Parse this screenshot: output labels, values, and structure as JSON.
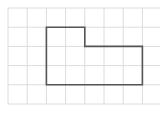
{
  "diagram": {
    "type": "grid-shape",
    "grid": {
      "origin_x": 8,
      "origin_y": 8,
      "cell_size": 19.2,
      "columns": 8,
      "rows": 5,
      "line_color": "#dcdcdc"
    },
    "shape": {
      "stroke_color": "#555555",
      "stroke_width": 1.6,
      "vertices_in_cells": [
        [
          2,
          1
        ],
        [
          4,
          1
        ],
        [
          4,
          2
        ],
        [
          7,
          2
        ],
        [
          7,
          4
        ],
        [
          2,
          4
        ]
      ]
    }
  }
}
